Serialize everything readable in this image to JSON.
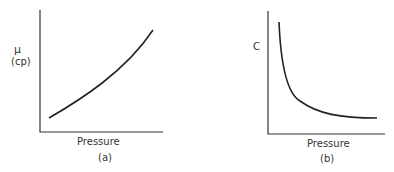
{
  "panels": [
    {
      "id": "a",
      "caption": "(a)",
      "xlabel": "Pressure",
      "ylabel_symbol": "μ",
      "ylabel_unit": "(cp)",
      "trend": "increasing, concave up"
    },
    {
      "id": "b",
      "caption": "(b)",
      "xlabel": "Pressure",
      "ylabel_symbol": "C",
      "trend": "decreasing, hyperbolic decay to asymptote"
    }
  ],
  "colors": {
    "line": "#222222",
    "axis": "#333333",
    "background": "#ffffff"
  }
}
